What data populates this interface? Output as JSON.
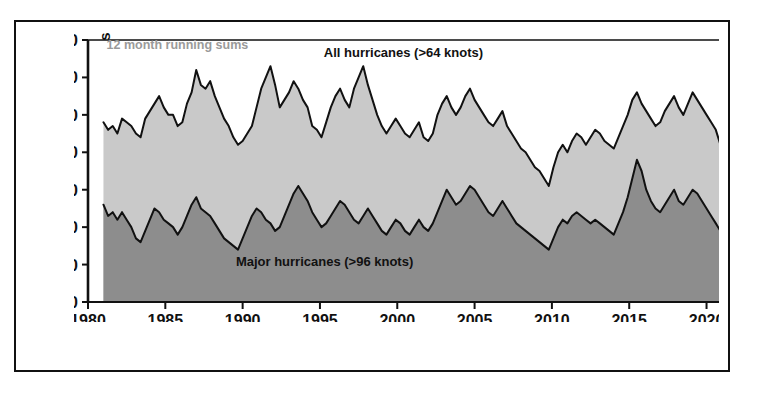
{
  "chart_data": {
    "type": "area",
    "title": "",
    "subtitle": "",
    "xlabel": "",
    "ylabel": "Number of hurricanes",
    "note": "12 month running sums",
    "xlim": [
      1980,
      2021
    ],
    "ylim": [
      0,
      70
    ],
    "grid": false,
    "legend_position": "inline-annotation",
    "stacked": false,
    "xticks": [
      1980,
      1985,
      1990,
      1995,
      2000,
      2005,
      2010,
      2015,
      2020
    ],
    "xtick_labels": [
      "1980",
      "1985",
      "1990",
      "1995",
      "2000",
      "2005",
      "2010",
      "2015",
      "2020"
    ],
    "yticks": [
      0,
      10,
      20,
      30,
      40,
      50,
      60,
      70
    ],
    "ytick_labels": [
      "0",
      "10",
      "20",
      "30",
      "40",
      "50",
      "60",
      "70"
    ],
    "colors": {
      "all_hurricanes_fill": "#c9c9c9",
      "major_hurricanes_fill": "#8d8d8d",
      "line": "#111111",
      "axis": "#111111",
      "note_text": "#9a9a9a",
      "background": "#ffffff"
    },
    "series": [
      {
        "name": "All hurricanes (>64 knots)",
        "label": "All hurricanes (>64 knots)",
        "threshold_knots": 64,
        "fill": "#c9c9c9",
        "x": [
          1981.0,
          1981.3,
          1981.6,
          1981.9,
          1982.2,
          1982.5,
          1982.8,
          1983.1,
          1983.4,
          1983.7,
          1984.0,
          1984.3,
          1984.6,
          1984.9,
          1985.2,
          1985.5,
          1985.8,
          1986.1,
          1986.4,
          1986.7,
          1987.0,
          1987.3,
          1987.6,
          1987.9,
          1988.2,
          1988.5,
          1988.8,
          1989.1,
          1989.4,
          1989.7,
          1990.0,
          1990.3,
          1990.6,
          1990.9,
          1991.2,
          1991.5,
          1991.8,
          1992.1,
          1992.4,
          1992.7,
          1993.0,
          1993.3,
          1993.6,
          1993.9,
          1994.2,
          1994.5,
          1994.8,
          1995.1,
          1995.4,
          1995.7,
          1996.0,
          1996.3,
          1996.6,
          1996.9,
          1997.2,
          1997.5,
          1997.8,
          1998.1,
          1998.4,
          1998.7,
          1999.0,
          1999.3,
          1999.6,
          1999.9,
          2000.2,
          2000.5,
          2000.8,
          2001.1,
          2001.4,
          2001.7,
          2002.0,
          2002.3,
          2002.6,
          2002.9,
          2003.2,
          2003.5,
          2003.8,
          2004.1,
          2004.4,
          2004.7,
          2005.0,
          2005.3,
          2005.6,
          2005.9,
          2006.2,
          2006.5,
          2006.8,
          2007.1,
          2007.4,
          2007.7,
          2008.0,
          2008.3,
          2008.6,
          2008.9,
          2009.2,
          2009.5,
          2009.8,
          2010.1,
          2010.4,
          2010.7,
          2011.0,
          2011.3,
          2011.6,
          2011.9,
          2012.2,
          2012.5,
          2012.8,
          2013.1,
          2013.4,
          2013.7,
          2014.0,
          2014.3,
          2014.6,
          2014.9,
          2015.2,
          2015.5,
          2015.8,
          2016.1,
          2016.4,
          2016.7,
          2017.0,
          2017.3,
          2017.6,
          2017.9,
          2018.2,
          2018.5,
          2018.8,
          2019.1,
          2019.4,
          2019.7,
          2020.0,
          2020.3,
          2020.6,
          2020.9
        ],
        "values": [
          48,
          46,
          47,
          45,
          49,
          48,
          47,
          45,
          44,
          49,
          51,
          53,
          55,
          52,
          50,
          50,
          47,
          48,
          53,
          56,
          62,
          58,
          57,
          59,
          55,
          52,
          49,
          47,
          44,
          42,
          43,
          45,
          47,
          52,
          57,
          60,
          63,
          58,
          52,
          54,
          56,
          59,
          57,
          54,
          52,
          47,
          46,
          44,
          48,
          52,
          55,
          57,
          54,
          52,
          57,
          60,
          63,
          58,
          54,
          50,
          47,
          45,
          47,
          49,
          47,
          45,
          44,
          46,
          48,
          44,
          43,
          45,
          50,
          53,
          55,
          52,
          50,
          52,
          55,
          57,
          54,
          52,
          50,
          48,
          47,
          49,
          51,
          47,
          45,
          43,
          41,
          40,
          38,
          36,
          35,
          33,
          31,
          36,
          40,
          42,
          40,
          43,
          45,
          44,
          42,
          44,
          46,
          45,
          43,
          42,
          41,
          44,
          47,
          50,
          54,
          56,
          53,
          51,
          49,
          47,
          48,
          51,
          53,
          55,
          52,
          50,
          53,
          56,
          54,
          52,
          50,
          48,
          46,
          42
        ]
      },
      {
        "name": "Major hurricanes (>96 knots)",
        "label": "Major hurricanes (>96 knots)",
        "threshold_knots": 96,
        "fill": "#8d8d8d",
        "x": [
          1981.0,
          1981.3,
          1981.6,
          1981.9,
          1982.2,
          1982.5,
          1982.8,
          1983.1,
          1983.4,
          1983.7,
          1984.0,
          1984.3,
          1984.6,
          1984.9,
          1985.2,
          1985.5,
          1985.8,
          1986.1,
          1986.4,
          1986.7,
          1987.0,
          1987.3,
          1987.6,
          1987.9,
          1988.2,
          1988.5,
          1988.8,
          1989.1,
          1989.4,
          1989.7,
          1990.0,
          1990.3,
          1990.6,
          1990.9,
          1991.2,
          1991.5,
          1991.8,
          1992.1,
          1992.4,
          1992.7,
          1993.0,
          1993.3,
          1993.6,
          1993.9,
          1994.2,
          1994.5,
          1994.8,
          1995.1,
          1995.4,
          1995.7,
          1996.0,
          1996.3,
          1996.6,
          1996.9,
          1997.2,
          1997.5,
          1997.8,
          1998.1,
          1998.4,
          1998.7,
          1999.0,
          1999.3,
          1999.6,
          1999.9,
          2000.2,
          2000.5,
          2000.8,
          2001.1,
          2001.4,
          2001.7,
          2002.0,
          2002.3,
          2002.6,
          2002.9,
          2003.2,
          2003.5,
          2003.8,
          2004.1,
          2004.4,
          2004.7,
          2005.0,
          2005.3,
          2005.6,
          2005.9,
          2006.2,
          2006.5,
          2006.8,
          2007.1,
          2007.4,
          2007.7,
          2008.0,
          2008.3,
          2008.6,
          2008.9,
          2009.2,
          2009.5,
          2009.8,
          2010.1,
          2010.4,
          2010.7,
          2011.0,
          2011.3,
          2011.6,
          2011.9,
          2012.2,
          2012.5,
          2012.8,
          2013.1,
          2013.4,
          2013.7,
          2014.0,
          2014.3,
          2014.6,
          2014.9,
          2015.2,
          2015.5,
          2015.8,
          2016.1,
          2016.4,
          2016.7,
          2017.0,
          2017.3,
          2017.6,
          2017.9,
          2018.2,
          2018.5,
          2018.8,
          2019.1,
          2019.4,
          2019.7,
          2020.0,
          2020.3,
          2020.6,
          2020.9
        ],
        "values": [
          26,
          23,
          24,
          22,
          24,
          22,
          20,
          17,
          16,
          19,
          22,
          25,
          24,
          22,
          21,
          20,
          18,
          20,
          23,
          26,
          28,
          25,
          24,
          23,
          21,
          19,
          17,
          16,
          15,
          14,
          17,
          20,
          23,
          25,
          24,
          22,
          21,
          19,
          20,
          23,
          26,
          29,
          31,
          29,
          27,
          24,
          22,
          20,
          21,
          23,
          25,
          27,
          26,
          24,
          22,
          21,
          23,
          25,
          23,
          21,
          19,
          18,
          20,
          22,
          21,
          19,
          18,
          20,
          22,
          20,
          19,
          21,
          24,
          27,
          30,
          28,
          26,
          27,
          29,
          31,
          30,
          28,
          26,
          24,
          23,
          25,
          27,
          25,
          23,
          21,
          20,
          19,
          18,
          17,
          16,
          15,
          14,
          17,
          20,
          22,
          21,
          23,
          24,
          23,
          22,
          21,
          22,
          21,
          20,
          19,
          18,
          21,
          24,
          28,
          33,
          38,
          35,
          30,
          27,
          25,
          24,
          26,
          28,
          30,
          27,
          26,
          28,
          30,
          29,
          27,
          25,
          23,
          21,
          19
        ]
      }
    ],
    "annotations": [
      {
        "id": "note-running-sums",
        "text": "12 month running sums",
        "x": 1981.2,
        "y": 67.5
      },
      {
        "id": "label-all-hurricanes",
        "text": "All hurricanes (>64 knots)",
        "x": 2000.4,
        "y": 65.5
      },
      {
        "id": "label-major-hurricanes",
        "text": "Major hurricanes (>96 knots)",
        "x": 1995.3,
        "y": 9.5
      }
    ]
  },
  "axis": {
    "y_title": "Number of hurricanes"
  }
}
